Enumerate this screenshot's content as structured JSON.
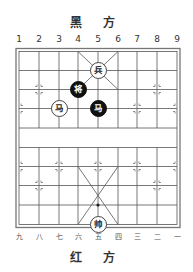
{
  "header": {
    "black_side_label": "黑 方"
  },
  "footer": {
    "red_side_label": "红 方"
  },
  "files_top": [
    "1",
    "2",
    "3",
    "4",
    "5",
    "6",
    "7",
    "8",
    "9"
  ],
  "files_bottom": [
    "九",
    "八",
    "七",
    "六",
    "五",
    "四",
    "三",
    "二",
    "一"
  ],
  "colors": {
    "board_line": "#555555",
    "black_piece": "#111111",
    "red_piece_fill": "#ffffff"
  },
  "pieces": [
    {
      "name": "red-soldier",
      "char": "兵",
      "side": "red",
      "file": 5,
      "rank": 2
    },
    {
      "name": "black-general",
      "char": "将",
      "side": "black",
      "file": 4,
      "rank": 3
    },
    {
      "name": "red-horse",
      "char": "马",
      "side": "red",
      "file": 3,
      "rank": 4
    },
    {
      "name": "black-horse",
      "char": "马",
      "side": "black",
      "file": 5,
      "rank": 4
    },
    {
      "name": "red-general",
      "char": "帅",
      "side": "red",
      "file": 5,
      "rank": 10
    }
  ]
}
